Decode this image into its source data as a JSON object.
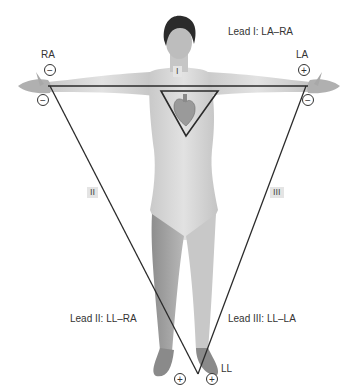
{
  "leads": {
    "lead1": "Lead I: LA–RA",
    "lead2": "Lead II: LL–RA",
    "lead3": "Lead III: LL–LA"
  },
  "roman": {
    "i": "I",
    "ii": "II",
    "iii": "III"
  },
  "electrodes": {
    "ra": "RA",
    "la": "LA",
    "ll": "LL"
  },
  "polarity": {
    "ra_top": "−",
    "ra_bottom": "−",
    "la_top": "+",
    "la_bottom": "−",
    "ll_left": "+",
    "ll_right": "+"
  },
  "colors": {
    "line": "#2a2a2a",
    "skin": "#d8d8d8",
    "skin_shade": "#a9a9a9",
    "hair": "#2b2b2b",
    "label_bg": "#e4e4e4"
  }
}
